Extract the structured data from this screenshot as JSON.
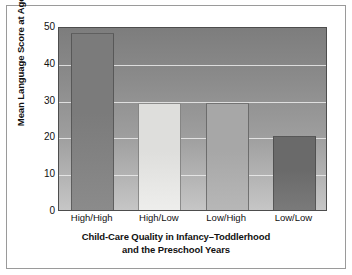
{
  "chart_data": {
    "type": "bar",
    "title": "",
    "xlabel": "Child-Care Quality in Infancy–Toddlerhood and the Preschool Years",
    "xlabel_lines": [
      "Child-Care Quality in Infancy–Toddlerhood",
      "and the Preschool Years"
    ],
    "ylabel": "Mean Language Score at Age 5",
    "categories": [
      "High/High",
      "High/Low",
      "Low/High",
      "Low/Low"
    ],
    "values": [
      48,
      29,
      29,
      20
    ],
    "ylim": [
      0,
      50
    ],
    "yticks": [
      0,
      10,
      20,
      30,
      40,
      50
    ],
    "ytick_labels": [
      "0",
      "10",
      "20",
      "30",
      "40",
      "50"
    ],
    "grid": true,
    "grid_axis": "y",
    "legend": "none",
    "bar_colors": [
      "#7b7b7b",
      "#dededc",
      "#a7a7a7",
      "#6a6a6a"
    ],
    "plot_background": "#9a9a9a",
    "gridline_color": "#ececec",
    "axis_color": "#4d4d4d",
    "text_color": "#111111",
    "frame_color": "#9a9a9a"
  }
}
